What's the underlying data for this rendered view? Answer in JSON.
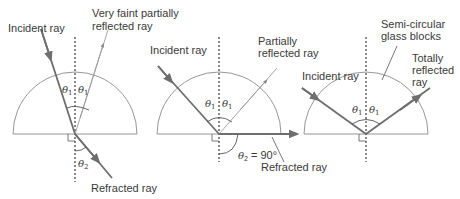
{
  "diagram": {
    "colors": {
      "ray": "#6e6e6e",
      "block": "#8a8a8a",
      "text": "#3a3a3a"
    },
    "panels": [
      {
        "id": "below-critical",
        "labels": {
          "incident": "Incident ray",
          "reflected_line1": "Very faint partially",
          "reflected_line2": "reflected ray",
          "refracted": "Refracted ray",
          "theta1_left": "θ",
          "theta1_left_sub": "1",
          "theta1_right": "θ",
          "theta1_right_sub": "1",
          "theta2": "θ",
          "theta2_sub": "2"
        }
      },
      {
        "id": "at-critical",
        "labels": {
          "incident": "Incident ray",
          "reflected_line1": "Partially",
          "reflected_line2": "reflected ray",
          "refracted": "Refracted ray",
          "theta1_left": "θ",
          "theta1_left_sub": "1",
          "theta1_right": "θ",
          "theta1_right_sub": "1",
          "theta2": "θ",
          "theta2_sub": "2",
          "theta2_value": " = 90°"
        }
      },
      {
        "id": "above-critical",
        "labels": {
          "block_line1": "Semi-circular",
          "block_line2": "glass blocks",
          "incident": "Incident ray",
          "reflected_line1": "Totally",
          "reflected_line2": "reflected",
          "reflected_line3": "ray",
          "theta1_left": "θ",
          "theta1_left_sub": "1",
          "theta1_right": "θ",
          "theta1_right_sub": "1"
        }
      }
    ]
  }
}
